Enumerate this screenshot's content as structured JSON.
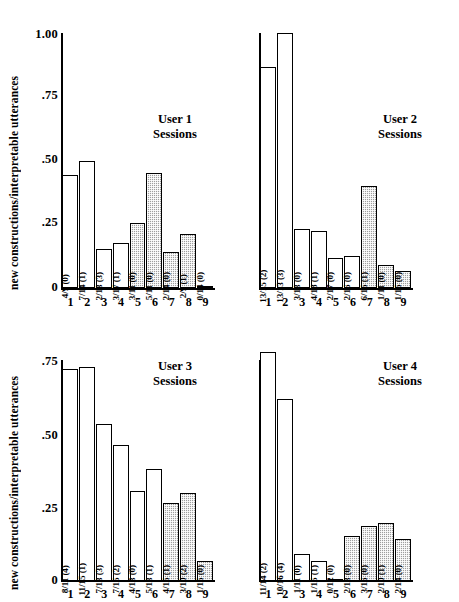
{
  "figure": {
    "ylabel": "new constructions/interpretable utterances",
    "xlabel": "Sessions",
    "yticks_top": [
      "1.00",
      ".75",
      ".50",
      ".25",
      "0"
    ],
    "yticks_bottom": [
      ".75",
      ".50",
      ".25",
      "0"
    ],
    "xticks": [
      "1",
      "2",
      "3",
      "4",
      "5",
      "6",
      "7",
      "8",
      "9"
    ],
    "colors": {
      "bar_open": "#ffffff",
      "bar_shaded": "#9e9e9e",
      "axis": "#000000"
    }
  },
  "chart_data": {
    "type": "bar",
    "title": "",
    "xlabel": "Sessions",
    "ylabel": "new constructions/interpretable utterances",
    "categories": [
      "1",
      "2",
      "3",
      "4",
      "5",
      "6",
      "7",
      "8",
      "9"
    ],
    "grid": false,
    "legend": null,
    "panels": [
      {
        "name": "User 1",
        "title_line1": "User 1",
        "title_line2": "Sessions",
        "ylim": [
          0,
          1.0
        ],
        "yticks": [
          0,
          0.25,
          0.5,
          0.75,
          1.0
        ],
        "values": [
          0.444,
          0.5,
          0.154,
          0.176,
          0.255,
          0.452,
          0.143,
          0.21,
          0.0
        ],
        "bar_labels": [
          "4/9 (0)",
          "7/14 (1)",
          "2/13 (3)",
          "3/17 (1)",
          "3/11 (0)",
          "5/11 (0)",
          "2/14 (0)",
          "2/9 (1)",
          "0/14 (0)"
        ],
        "shaded": [
          false,
          false,
          false,
          false,
          true,
          true,
          true,
          true,
          true
        ]
      },
      {
        "name": "User 2",
        "title_line1": "User 2",
        "title_line2": "Sessions",
        "ylim": [
          0,
          1.0
        ],
        "yticks": [
          0,
          0.25,
          0.5,
          0.75,
          1.0
        ],
        "values": [
          0.867,
          1.0,
          0.231,
          0.222,
          0.118,
          0.125,
          0.4,
          0.091,
          0.067
        ],
        "bar_labels": [
          "13/15 (2)",
          "13/13 (3)",
          "3/13 (0)",
          "4/18 (1)",
          "2/17 (0)",
          "2/16 (0)",
          "6/15 (1)",
          "1/11 (0)",
          "1/15 (0)"
        ],
        "shaded": [
          false,
          false,
          false,
          false,
          false,
          false,
          true,
          true,
          true
        ]
      },
      {
        "name": "User 3",
        "title_line1": "User 3",
        "title_line2": "Sessions",
        "ylim": [
          0,
          0.75
        ],
        "yticks": [
          0,
          0.25,
          0.5,
          0.75
        ],
        "values": [
          0.727,
          0.733,
          0.538,
          0.467,
          0.308,
          0.385,
          0.267,
          0.3,
          0.067
        ],
        "bar_labels": [
          "8/11 (4)",
          "11/15 (1)",
          "7/13 (3)",
          "7/15 (2)",
          "4/13 (0)",
          "5/13 (1)",
          "4/15 (1)",
          "3/10 (2)",
          "1/15 (0)"
        ],
        "shaded": [
          false,
          false,
          false,
          false,
          false,
          false,
          true,
          true,
          true
        ]
      },
      {
        "name": "User 4",
        "title_line1": "User 4",
        "title_line2": "Sessions",
        "ylim": [
          0,
          0.75
        ],
        "yticks": [
          0,
          0.25,
          0.5,
          0.75
        ],
        "values": [
          0.786,
          0.625,
          0.091,
          0.067,
          0.0,
          0.154,
          0.188,
          0.2,
          0.143
        ],
        "bar_labels": [
          "11/14 (2)",
          "10/16 (4)",
          "1/11 (0)",
          "1/15 (1)",
          "0/12 (0)",
          "2/13 (0)",
          "3/16 (0)",
          "2/10 (1)",
          "2/14 (0)"
        ],
        "shaded": [
          false,
          false,
          false,
          false,
          false,
          true,
          true,
          true,
          true
        ]
      }
    ]
  }
}
